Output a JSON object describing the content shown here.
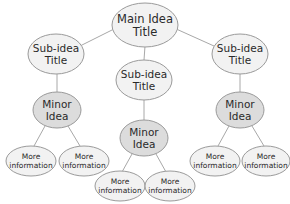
{
  "diagram": {
    "type": "concept-map",
    "colors": {
      "sub_fill": "#f2f2f2",
      "minor_fill": "#dcdcdc",
      "stroke": "#9a9a9a",
      "edge": "#a8a8a8",
      "text": "#2a2a2a"
    },
    "main": {
      "line1": "Main Idea",
      "line2": "Title"
    },
    "subs": [
      {
        "line1": "Sub-idea",
        "line2": "Title"
      },
      {
        "line1": "Sub-idea",
        "line2": "Title"
      },
      {
        "line1": "Sub-idea",
        "line2": "Title"
      }
    ],
    "minors": [
      {
        "line1": "Minor",
        "line2": "Idea"
      },
      {
        "line1": "Minor",
        "line2": "Idea"
      },
      {
        "line1": "Minor",
        "line2": "Idea"
      }
    ],
    "details": [
      {
        "line1": "More",
        "line2": "information"
      },
      {
        "line1": "More",
        "line2": "information"
      },
      {
        "line1": "More",
        "line2": "information"
      },
      {
        "line1": "More",
        "line2": "information"
      },
      {
        "line1": "More",
        "line2": "information"
      },
      {
        "line1": "More",
        "line2": "information"
      }
    ]
  }
}
